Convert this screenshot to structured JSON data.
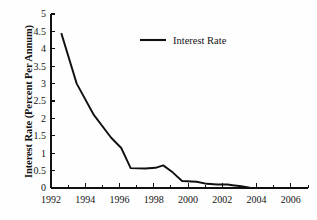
{
  "chart_data": {
    "type": "line",
    "title": "",
    "xlabel": "",
    "ylabel": "Interest Rate (Percent Per Annum)",
    "xlim": [
      1992,
      2007
    ],
    "ylim": [
      0,
      5
    ],
    "grid": false,
    "legend_position": "inside-top-center",
    "x_tick_labels": [
      "1992",
      "1994",
      "1996",
      "1998",
      "2000",
      "2002",
      "2004",
      "2006"
    ],
    "x_tick_values": [
      1992,
      1994,
      1996,
      1998,
      2000,
      2002,
      2004,
      2006
    ],
    "x_minor_tick_values": [
      1993,
      1995,
      1997,
      1999,
      2001,
      2003,
      2005,
      2007
    ],
    "y_tick_labels": [
      "0",
      "0.5",
      "1",
      "1.5",
      "2",
      "2.5",
      "3",
      "3.5",
      "4",
      "4.5",
      "5"
    ],
    "y_tick_values": [
      0,
      0.5,
      1,
      1.5,
      2,
      2.5,
      3,
      3.5,
      4,
      4.5,
      5
    ],
    "series": [
      {
        "name": "Interest Rate",
        "color": "#101010",
        "x": [
          1992.6,
          1993.5,
          1994.5,
          1995.5,
          1996.1,
          1996.65,
          1997.5,
          1998.1,
          1998.55,
          1999.1,
          1999.65,
          2000.5,
          2001.1,
          2001.7,
          2002.3,
          2002.6,
          2003.1,
          2003.6,
          2004.5,
          2005.5,
          2006.5,
          2007.0
        ],
        "y": [
          4.45,
          3.0,
          2.1,
          1.45,
          1.15,
          0.57,
          0.56,
          0.58,
          0.65,
          0.45,
          0.2,
          0.18,
          0.12,
          0.1,
          0.1,
          0.08,
          0.05,
          0.01,
          0.0,
          0.0,
          0.0,
          0.0
        ]
      }
    ]
  },
  "legend": {
    "entries": [
      {
        "label": "Interest Rate"
      }
    ]
  }
}
